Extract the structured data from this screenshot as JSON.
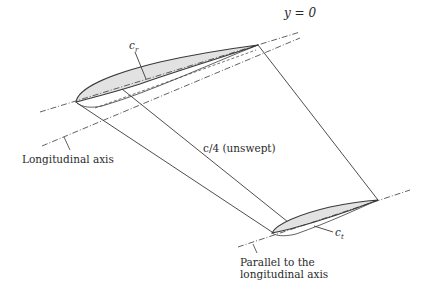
{
  "diagram": {
    "labels": {
      "y_eq_0": "y = 0",
      "root_chord": "c",
      "root_chord_sub": "r",
      "tip_chord": "c",
      "tip_chord_sub": "t",
      "quarter_chord": "c/4 (unswept)",
      "longitudinal_axis": "Longitudinal axis",
      "parallel_line1": "Parallel to the",
      "parallel_line2": "longitudinal axis"
    },
    "colors": {
      "stroke": "#3a3a3a",
      "fill": "#dcdcdc"
    }
  }
}
